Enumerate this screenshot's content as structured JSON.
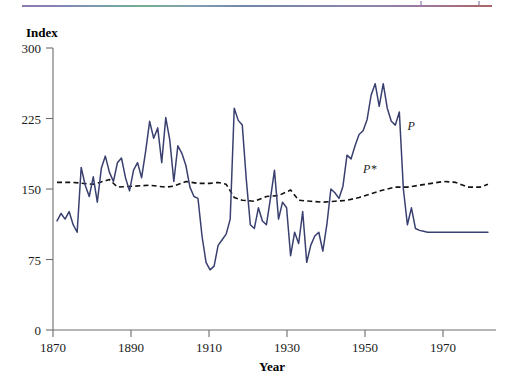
{
  "figure": {
    "background_color": "#ffffff",
    "top_rule": {
      "name": "decorative-gradient-rule",
      "colors": [
        "#7a5fa0",
        "#5f9f7a",
        "#5a6f9a",
        "#a04a50"
      ]
    }
  },
  "chart_data": {
    "type": "line",
    "title": "",
    "subtitle": "",
    "xlabel": "Year",
    "ylabel": "Index",
    "xlim": [
      1870,
      1980
    ],
    "ylim": [
      0,
      300
    ],
    "xticks": [
      1870,
      1890,
      1910,
      1930,
      1950,
      1970
    ],
    "yticks": [
      0,
      75,
      150,
      225,
      300
    ],
    "grid": false,
    "legend_position": "inline-annotation",
    "annotations": [
      {
        "text": "P",
        "x": 1958,
        "y": 213,
        "style": "italic"
      },
      {
        "text": "P*",
        "x": 1947,
        "y": 167,
        "style": "italic"
      }
    ],
    "series": [
      {
        "name": "P",
        "label": "P",
        "style": "solid",
        "color": "#39406f",
        "x": [
          1871,
          1872,
          1873,
          1874,
          1875,
          1876,
          1877,
          1878,
          1879,
          1880,
          1881,
          1882,
          1883,
          1884,
          1885,
          1886,
          1887,
          1888,
          1889,
          1890,
          1891,
          1892,
          1893,
          1894,
          1895,
          1896,
          1897,
          1898,
          1899,
          1900,
          1901,
          1902,
          1903,
          1904,
          1905,
          1906,
          1907,
          1908,
          1909,
          1910,
          1911,
          1912,
          1913,
          1914,
          1915,
          1916,
          1917,
          1918,
          1919,
          1920,
          1921,
          1922,
          1923,
          1924,
          1925,
          1926,
          1927,
          1928,
          1929,
          1930,
          1931,
          1932,
          1933,
          1934,
          1935,
          1936,
          1937,
          1938,
          1939,
          1940,
          1941,
          1942,
          1943,
          1944,
          1945,
          1946,
          1947,
          1948,
          1949,
          1950,
          1951,
          1952,
          1953,
          1954,
          1955,
          1956,
          1957,
          1958,
          1959,
          1960,
          1961,
          1962,
          1963,
          1964,
          1965,
          1966,
          1967,
          1968,
          1969,
          1970,
          1971,
          1972,
          1973,
          1974,
          1975,
          1976,
          1977,
          1978
        ],
        "values": [
          116,
          124,
          118,
          126,
          112,
          104,
          173,
          154,
          142,
          163,
          136,
          172,
          185,
          168,
          158,
          178,
          183,
          162,
          148,
          170,
          178,
          162,
          190,
          222,
          204,
          215,
          178,
          226,
          202,
          158,
          196,
          188,
          175,
          152,
          142,
          140,
          100,
          72,
          64,
          68,
          90,
          96,
          102,
          118,
          236,
          223,
          218,
          160,
          112,
          108,
          130,
          116,
          112,
          140,
          170,
          118,
          136,
          130,
          79,
          104,
          92,
          126,
          72,
          90,
          100,
          104,
          84,
          112,
          150,
          146,
          140,
          153,
          186,
          182,
          196,
          208,
          212,
          224,
          250,
          262,
          238,
          262,
          236,
          222,
          218,
          232,
          150,
          112,
          130,
          108,
          106,
          105,
          104,
          104,
          104,
          104,
          104,
          104,
          104,
          104,
          104,
          104,
          104,
          104,
          104,
          104,
          104,
          104
        ]
      },
      {
        "name": "P*",
        "label": "P*",
        "style": "dashed",
        "color": "#121212",
        "x": [
          1871,
          1875,
          1880,
          1884,
          1886,
          1890,
          1894,
          1898,
          1900,
          1903,
          1906,
          1909,
          1911,
          1913,
          1915,
          1917,
          1920,
          1923,
          1926,
          1929,
          1931,
          1934,
          1937,
          1940,
          1943,
          1946,
          1949,
          1952,
          1955,
          1958,
          1961,
          1964,
          1967,
          1970,
          1973,
          1976,
          1978
        ],
        "values": [
          157,
          157,
          155,
          160,
          152,
          153,
          154,
          152,
          153,
          158,
          156,
          156,
          157,
          155,
          141,
          138,
          137,
          142,
          143,
          149,
          138,
          137,
          136,
          137,
          138,
          141,
          145,
          149,
          152,
          152,
          154,
          156,
          158,
          157,
          152,
          152,
          155
        ]
      }
    ]
  },
  "labels": {
    "y_axis_title": "Index",
    "x_axis_title": "Year",
    "y_tick_labels": [
      "0",
      "75",
      "150",
      "225",
      "300"
    ],
    "x_tick_labels": [
      "1870",
      "1890",
      "1910",
      "1930",
      "1950",
      "1970"
    ],
    "series_p": "P",
    "series_pstar": "P*"
  },
  "colors": {
    "series_p": "#39406f",
    "series_pstar": "#121212",
    "axis": "#6d6d6d",
    "text": "#1a1a1a"
  }
}
